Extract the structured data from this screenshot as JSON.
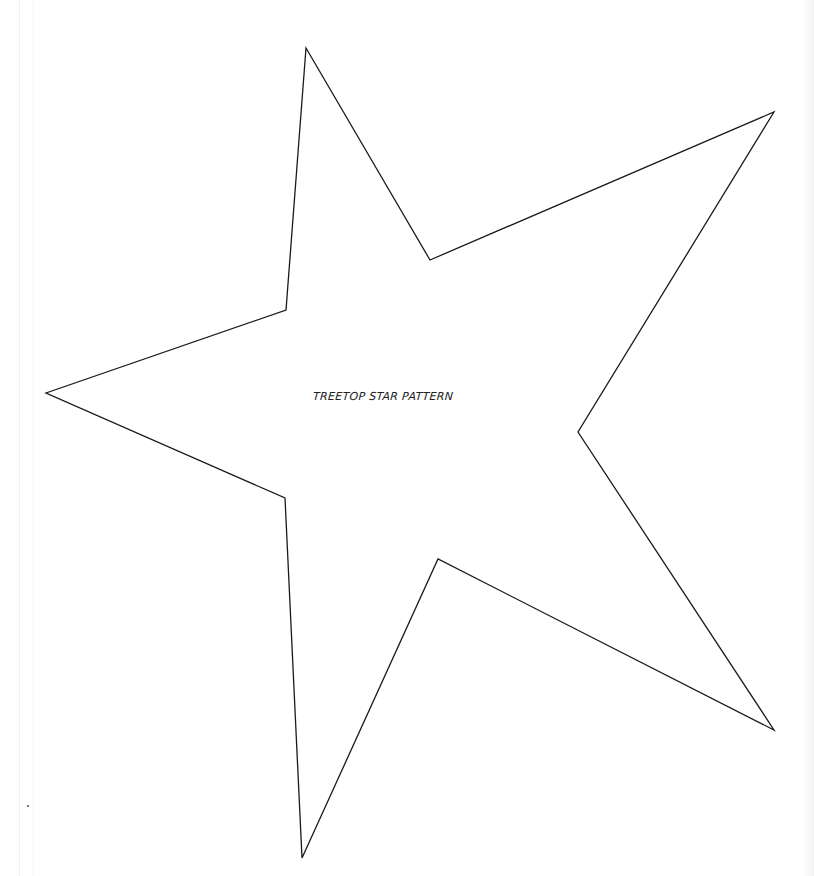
{
  "document": {
    "type": "printable-pattern",
    "caption": "TREETOP STAR PATTERN"
  },
  "star": {
    "stroke_color": "#1a1a1a",
    "fill_color": "#ffffff",
    "stroke_width": 1.3,
    "points": "306,48 430,260 774,112 578,432 774,730 438,559 302,858 285,498 46,393 286,310"
  }
}
